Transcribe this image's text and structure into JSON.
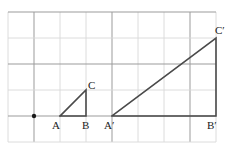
{
  "figure": {
    "width": 245,
    "height": 158,
    "background_color": "#ffffff"
  },
  "grid": {
    "minor_color": "#d8d8d8",
    "major_color": "#9b9b9b",
    "cell_size": 26,
    "x_lines": [
      8,
      34,
      60,
      86,
      112,
      138,
      164,
      190,
      216
    ],
    "y_lines": [
      12,
      38,
      64,
      90,
      116,
      142
    ],
    "major_x_lines": [
      34,
      112,
      190
    ],
    "major_y_lines": [
      12,
      64,
      116
    ],
    "columns": 8,
    "rows": 5
  },
  "center_point": {
    "name": "center-of-dilation",
    "x": 34,
    "y": 116,
    "radius": 2.2,
    "color": "#1a1a1a"
  },
  "shapes": {
    "stroke_color": "#4a4a4a",
    "stroke_width": 1.6,
    "small_triangle": {
      "name": "triangle-ABC",
      "vertices": [
        {
          "label": "A",
          "x": 60,
          "y": 116
        },
        {
          "label": "B",
          "x": 86,
          "y": 116
        },
        {
          "label": "C",
          "x": 86,
          "y": 90
        }
      ],
      "points_attr": "60,116 86,116 86,90 60,116"
    },
    "large_triangle": {
      "name": "triangle-A-prime-B-prime-C-prime",
      "vertices": [
        {
          "label": "A'",
          "x": 112,
          "y": 116
        },
        {
          "label": "B'",
          "x": 216,
          "y": 116
        },
        {
          "label": "C'",
          "x": 216,
          "y": 38
        }
      ],
      "points_attr": "112,116 216,116 216,38 112,116"
    }
  },
  "labels": {
    "a": {
      "text": "A",
      "base": "A",
      "prime": "",
      "left": 52,
      "top": 120
    },
    "b": {
      "text": "B",
      "base": "B",
      "prime": "",
      "left": 82,
      "top": 120
    },
    "c": {
      "text": "C",
      "base": "C",
      "prime": "",
      "left": 88,
      "top": 80
    },
    "a_prime": {
      "text": "A′",
      "base": "A",
      "prime": "′",
      "left": 104,
      "top": 120
    },
    "b_prime": {
      "text": "B′",
      "base": "B",
      "prime": "′",
      "left": 207,
      "top": 120
    },
    "c_prime": {
      "text": "C′",
      "base": "C",
      "prime": "′",
      "left": 215,
      "top": 25
    }
  },
  "chart_data": {
    "type": "scatter",
    "xlabel": "",
    "ylabel": "",
    "xlim": [
      0,
      8
    ],
    "ylim": [
      0,
      5
    ],
    "grid": true,
    "legend": "none",
    "annotations": [
      "A",
      "B",
      "C",
      "A′",
      "B′",
      "C′"
    ],
    "series": [
      {
        "name": "center of dilation",
        "type": "scatter",
        "x": [
          1
        ],
        "y": [
          1
        ]
      },
      {
        "name": "triangle ABC",
        "type": "line",
        "x": [
          2,
          3,
          3,
          2
        ],
        "y": [
          1,
          1,
          2,
          1
        ],
        "point_labels": [
          "A",
          "B",
          "C",
          ""
        ]
      },
      {
        "name": "triangle A'B'C'",
        "type": "line",
        "x": [
          4,
          8,
          8,
          4
        ],
        "y": [
          1,
          1,
          4,
          1
        ],
        "point_labels": [
          "A′",
          "B′",
          "C′",
          ""
        ]
      }
    ]
  }
}
